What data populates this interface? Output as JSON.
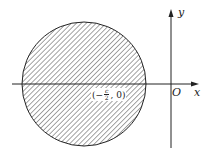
{
  "diagram": {
    "axes": {
      "x_label": "x",
      "y_label": "y",
      "origin_label": "O"
    },
    "circle": {
      "center": {
        "cx": 84,
        "cy": 84
      },
      "radius": 62,
      "fill": "hatched",
      "center_label": {
        "open": "(",
        "sign": "−",
        "numerator": "c",
        "denominator": "2",
        "rest": ", 0)"
      }
    },
    "colors": {
      "stroke": "#222222",
      "hatch": "#333333",
      "background": "#ffffff"
    }
  }
}
